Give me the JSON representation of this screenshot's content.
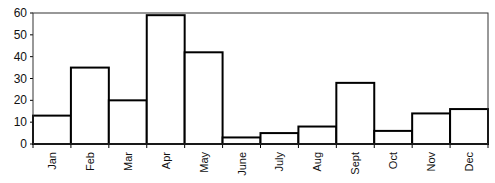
{
  "chart_data": {
    "type": "bar",
    "title": "",
    "xlabel": "",
    "ylabel": "",
    "categories": [
      "Jan",
      "Feb",
      "Mar",
      "Apr",
      "May",
      "June",
      "July",
      "Aug",
      "Sept",
      "Oct",
      "Nov",
      "Dec"
    ],
    "values": [
      13,
      35,
      20,
      59,
      42,
      3,
      5,
      8,
      28,
      6,
      14,
      16
    ],
    "ylim": [
      0,
      60
    ],
    "yticks": [
      0,
      10,
      20,
      30,
      40,
      50,
      60
    ],
    "grid": false,
    "legend": null,
    "bar_fill": "#ffffff",
    "bar_stroke": "#000000"
  }
}
